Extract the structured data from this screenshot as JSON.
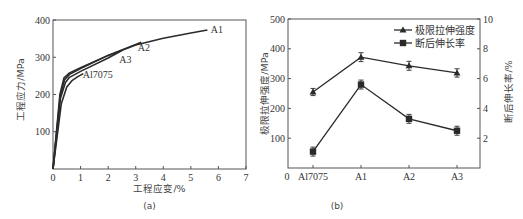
{
  "chart_data": [
    {
      "panel": "a",
      "type": "line",
      "title": "",
      "panel_label": "(a)",
      "xlabel": "工程应变/%",
      "ylabel": "工程应力/MPa",
      "xlim": [
        0,
        7
      ],
      "ylim": [
        0,
        400
      ],
      "xticks": [
        "0",
        "1",
        "2",
        "3",
        "4",
        "5",
        "6",
        "7"
      ],
      "yticks": [
        "100",
        "200",
        "300",
        "400"
      ],
      "grid": false,
      "series": [
        {
          "name": "A1",
          "x": [
            0,
            0.25,
            0.4,
            0.6,
            1.0,
            2.0,
            3.0,
            4.0,
            5.0,
            5.6
          ],
          "y": [
            0,
            200,
            245,
            258,
            272,
            305,
            333,
            351,
            365,
            373
          ]
        },
        {
          "name": "A2",
          "x": [
            0,
            0.26,
            0.42,
            0.6,
            1.0,
            2.0,
            3.0,
            3.2
          ],
          "y": [
            0,
            195,
            240,
            254,
            270,
            305,
            334,
            340
          ]
        },
        {
          "name": "A3",
          "x": [
            0,
            0.27,
            0.45,
            0.6,
            1.0,
            2.0,
            2.5
          ],
          "y": [
            0,
            190,
            232,
            246,
            262,
            298,
            318
          ]
        },
        {
          "name": "Al7075",
          "x": [
            0,
            0.3,
            0.5,
            0.7,
            0.9,
            1.1
          ],
          "y": [
            0,
            175,
            220,
            238,
            248,
            256
          ]
        }
      ],
      "annotations": [
        "A1",
        "A2",
        "A3",
        "Al7075"
      ]
    },
    {
      "panel": "b",
      "type": "line",
      "title": "",
      "panel_label": "(b)",
      "categories": [
        "Al7075",
        "A1",
        "A2",
        "A3"
      ],
      "x_origin_label": "0",
      "ylabel": "极限拉伸强度/MPa",
      "ylabel_right": "断后伸长率/%",
      "ylim": [
        0,
        500
      ],
      "ylim_right": [
        0,
        10
      ],
      "yticks": [
        "100",
        "200",
        "300",
        "400",
        "500"
      ],
      "yticks_right": [
        "2",
        "4",
        "6",
        "8",
        "10"
      ],
      "legend_position": "upper right",
      "grid": false,
      "series": [
        {
          "name": "极限拉伸强度",
          "axis": "left",
          "marker": "triangle",
          "values": [
            255,
            372,
            343,
            319
          ],
          "error": [
            12,
            15,
            15,
            14
          ]
        },
        {
          "name": "断后伸长率",
          "axis": "right",
          "marker": "square",
          "values": [
            1.1,
            5.6,
            3.3,
            2.5
          ],
          "error": [
            0.3,
            0.3,
            0.3,
            0.3
          ]
        }
      ]
    }
  ],
  "colors": {
    "line": "#2a2a2a",
    "axis": "#555555",
    "text": "#333333"
  }
}
